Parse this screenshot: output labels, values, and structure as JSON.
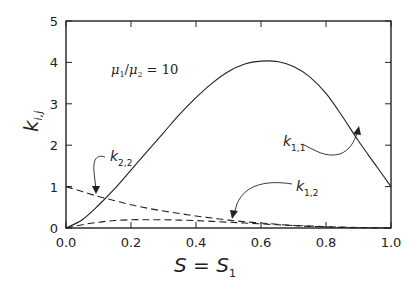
{
  "chart_data": {
    "type": "line",
    "title": "",
    "xlabel": "S = S1",
    "ylabel": "k_{i,j}",
    "xlim": [
      0.0,
      1.0
    ],
    "ylim": [
      0,
      5
    ],
    "xticks": [
      "0.0",
      "0.2",
      "0.4",
      "0.6",
      "0.8",
      "1.0"
    ],
    "yticks": [
      "0",
      "1",
      "2",
      "3",
      "4",
      "5"
    ],
    "grid": false,
    "legend": null,
    "annotation": "μ1/μ2 = 10",
    "x": [
      0.0,
      0.05,
      0.1,
      0.15,
      0.2,
      0.25,
      0.3,
      0.35,
      0.4,
      0.45,
      0.5,
      0.55,
      0.6,
      0.65,
      0.7,
      0.75,
      0.8,
      0.85,
      0.9,
      0.95,
      1.0
    ],
    "series": [
      {
        "name": "k1,1",
        "style": "solid",
        "values": [
          0.0,
          0.2,
          0.55,
          0.95,
          1.4,
          1.85,
          2.3,
          2.75,
          3.15,
          3.5,
          3.78,
          3.96,
          4.03,
          4.02,
          3.9,
          3.65,
          3.25,
          2.7,
          2.1,
          1.55,
          1.0
        ]
      },
      {
        "name": "k1,2",
        "style": "dashed",
        "values": [
          0.0,
          0.08,
          0.14,
          0.18,
          0.2,
          0.2,
          0.2,
          0.19,
          0.18,
          0.16,
          0.14,
          0.12,
          0.1,
          0.08,
          0.06,
          0.05,
          0.03,
          0.02,
          0.01,
          0.005,
          0.0
        ]
      },
      {
        "name": "k2,2",
        "style": "dashed",
        "values": [
          1.0,
          0.88,
          0.76,
          0.66,
          0.56,
          0.48,
          0.41,
          0.35,
          0.29,
          0.24,
          0.19,
          0.15,
          0.12,
          0.09,
          0.06,
          0.04,
          0.03,
          0.015,
          0.007,
          0.002,
          0.0
        ]
      }
    ],
    "labels": {
      "k11": "k1,1",
      "k12": "k1,2",
      "k22": "k2,2"
    }
  }
}
